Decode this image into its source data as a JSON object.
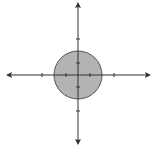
{
  "diagram": {
    "type": "coordinate-plane-with-shaded-circle",
    "axes": {
      "origin_px": [
        78,
        75
      ],
      "unit_px": 12,
      "x_arrows": "both",
      "y_arrows": "both",
      "tick_units": [
        -3,
        -1,
        1,
        3
      ],
      "color": "#333333"
    },
    "circle": {
      "center": [
        0,
        0
      ],
      "radius_units": 2,
      "fill": "#b3b3b3",
      "stroke": "#555555"
    }
  }
}
